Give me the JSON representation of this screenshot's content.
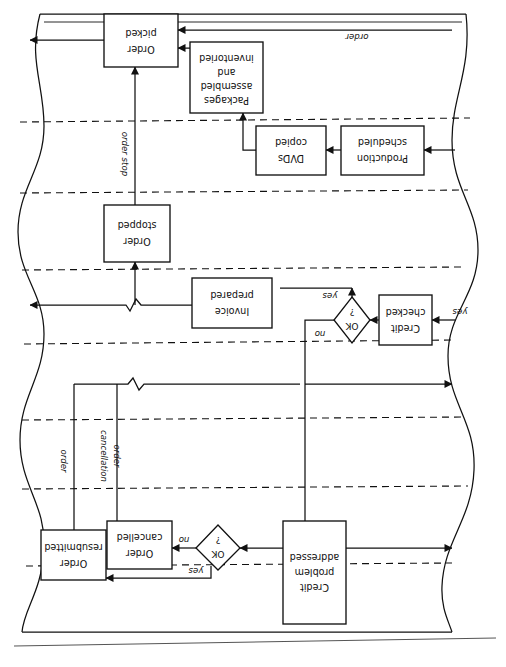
{
  "page": {
    "orientation_note": "rotated-180",
    "background_color": "#ffffff",
    "ink_color": "#111111",
    "width": 506,
    "height": 667
  },
  "diagram": {
    "type": "swimlane-flowchart",
    "lane_divider_style": "dashed",
    "page_edge_style": "wavy-scan-curl",
    "nodes": [
      {
        "id": "order-picked",
        "shape": "process",
        "label": "Order picked",
        "lines": [
          "Order",
          "picked"
        ]
      },
      {
        "id": "packages-assembled",
        "shape": "process",
        "label": "Packages assembled and inventoried",
        "lines": [
          "Packages",
          "assembled",
          "and",
          "inventoried"
        ]
      },
      {
        "id": "dvds-copied",
        "shape": "process",
        "label": "DVDs copied",
        "lines": [
          "DVDs",
          "copied"
        ]
      },
      {
        "id": "production-scheduled",
        "shape": "process",
        "label": "Production scheduled",
        "lines": [
          "Production",
          "scheduled"
        ]
      },
      {
        "id": "order-stopped",
        "shape": "process",
        "label": "Order stopped",
        "lines": [
          "Order",
          "stopped"
        ]
      },
      {
        "id": "invoice-prepared",
        "shape": "process",
        "label": "Invoice prepared",
        "lines": [
          "Invoice",
          "prepared"
        ]
      },
      {
        "id": "credit-checked",
        "shape": "process",
        "label": "Credit checked",
        "lines": [
          "Credit",
          "checked"
        ]
      },
      {
        "id": "order-resubmitted",
        "shape": "process",
        "label": "Order resubmitted",
        "lines": [
          "Order",
          "resubmitted"
        ]
      },
      {
        "id": "order-cancelled",
        "shape": "process",
        "label": "Order cancelled",
        "lines": [
          "Order",
          "cancelled"
        ]
      },
      {
        "id": "credit-problem-addressed",
        "shape": "process",
        "label": "Credit problem addressed",
        "lines": [
          "Credit",
          "problem",
          "addressed"
        ]
      },
      {
        "id": "ok-decision-upper",
        "shape": "decision",
        "label": "OK ?",
        "lines": [
          "OK",
          "?"
        ]
      },
      {
        "id": "ok-decision-lower",
        "shape": "decision",
        "label": "OK ?",
        "lines": [
          "OK",
          "?"
        ]
      }
    ],
    "edge_labels": [
      {
        "id": "order-top",
        "text": "order"
      },
      {
        "id": "order-stop",
        "text": "order stop"
      },
      {
        "id": "order-cancellation",
        "text": "order cancellation",
        "lines": [
          "order",
          "cancellation"
        ]
      },
      {
        "id": "order-left",
        "text": "order"
      },
      {
        "id": "yes-upper-decision",
        "text": "yes"
      },
      {
        "id": "no-upper-decision",
        "text": "no"
      },
      {
        "id": "yes-right-entry",
        "text": "yes"
      },
      {
        "id": "yes-lower-decision",
        "text": "yes"
      },
      {
        "id": "no-lower-decision",
        "text": "no"
      }
    ]
  }
}
